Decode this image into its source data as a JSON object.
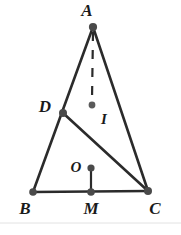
{
  "figure": {
    "canvas": {
      "width": 181,
      "height": 235
    },
    "background_color": "#ffffff",
    "stroke_color": "#2b2b2b",
    "dot_color": "#555555",
    "points": {
      "A": {
        "label": "A",
        "x": 93,
        "y": 27,
        "label_x": 87,
        "label_y": 16
      },
      "B": {
        "label": "B",
        "x": 33,
        "y": 192,
        "label_x": 23,
        "label_y": 214
      },
      "C": {
        "label": "C",
        "x": 148,
        "y": 191,
        "label_x": 150,
        "label_y": 214
      },
      "D": {
        "label": "D",
        "x": 63,
        "y": 113,
        "label_x": 40,
        "label_y": 112
      },
      "I": {
        "label": "I",
        "x": 92,
        "y": 105,
        "label_x": 100,
        "label_y": 123
      },
      "O": {
        "label": "O",
        "x": 91,
        "y": 168,
        "label_x": 72,
        "label_y": 172
      },
      "M": {
        "label": "M",
        "x": 91,
        "y": 192,
        "label_x": 83,
        "label_y": 214
      }
    },
    "segments": [
      {
        "name": "segment-AB",
        "from": "A",
        "to": "B",
        "style": "solid"
      },
      {
        "name": "segment-AC",
        "from": "A",
        "to": "C",
        "style": "solid"
      },
      {
        "name": "segment-BC",
        "from": "B",
        "to": "C",
        "style": "solid"
      },
      {
        "name": "segment-DC",
        "from": "D",
        "to": "C",
        "style": "solid"
      },
      {
        "name": "segment-AI",
        "from": "A",
        "to": "I",
        "style": "dashed"
      },
      {
        "name": "segment-OM",
        "from": "O",
        "to": "M",
        "style": "solid"
      }
    ]
  }
}
